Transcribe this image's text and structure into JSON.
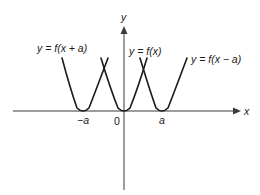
{
  "diagram": {
    "axes": {
      "x_label": "x",
      "y_label": "y",
      "origin_label": "0"
    },
    "tick_labels": [
      {
        "id": "neg-a",
        "text": "−a"
      },
      {
        "id": "pos-a",
        "text": "a"
      }
    ],
    "curves": [
      {
        "id": "shift-left",
        "label": "y = f(x + a)",
        "vertex_x_label": "−a"
      },
      {
        "id": "original",
        "label": "y = f(x)",
        "vertex_x_label": "0"
      },
      {
        "id": "shift-right",
        "label": "y = f(x − a)",
        "vertex_x_label": "a"
      }
    ],
    "colors": {
      "curve": "#1a1a1a",
      "axis": "#3a3a3a",
      "background": "#ffffff"
    }
  }
}
